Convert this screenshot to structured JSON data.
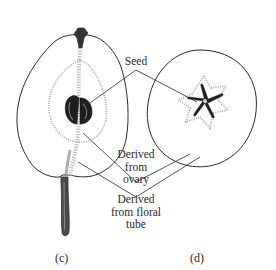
{
  "figure": {
    "labels": {
      "seed": "Seed",
      "ovary": [
        "Derived",
        "from",
        "ovary"
      ],
      "floral_tube": [
        "Derived",
        "from floral",
        "tube"
      ]
    },
    "panels": {
      "c": "(c)",
      "d": "(d)"
    },
    "panel_c_subject": "pear-longitudinal-section",
    "panel_d_subject": "apple-cross-section",
    "colors": {
      "ink": "#2a2a2a",
      "seed_fill": "#1e1e1e",
      "core_stipple": "#9a9a9a",
      "background": "#ffffff"
    }
  }
}
